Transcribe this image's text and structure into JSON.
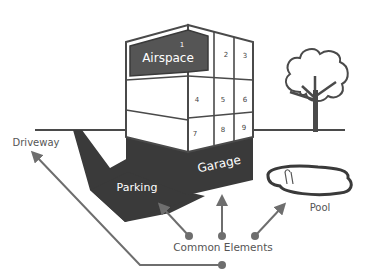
{
  "diagram": {
    "title_cutoff": "",
    "colors": {
      "dark": "#3a3a3a",
      "line": "#4a4a4a",
      "arrow": "#6e6e6e",
      "text": "#555555",
      "white": "#ffffff"
    },
    "building": {
      "airspace_label": "Airspace",
      "units": [
        "1",
        "2",
        "3",
        "4",
        "5",
        "6",
        "7",
        "8",
        "9"
      ],
      "garage_label": "Garage",
      "parking_label": "Parking"
    },
    "labels": {
      "driveway": "Driveway",
      "pool": "Pool",
      "common_elements": "Common Elements"
    }
  }
}
